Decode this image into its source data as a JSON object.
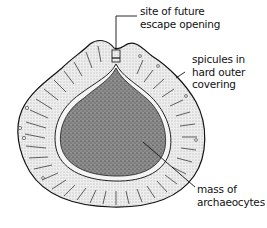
{
  "diagram": {
    "labels": {
      "escape_opening": {
        "line1": "site of future",
        "line2": "escape opening"
      },
      "spicules": {
        "line1": "spicules in",
        "line2": "hard outer",
        "line3": "covering"
      },
      "archaeocytes": {
        "line1": "mass of",
        "line2": "archaeocytes"
      }
    },
    "colors": {
      "ink": "#111111",
      "inner_mass": "#8a8a8a",
      "outer_covering": "#e4e4e4",
      "inner_membrane": "#ffffff",
      "background": "#ffffff"
    }
  }
}
